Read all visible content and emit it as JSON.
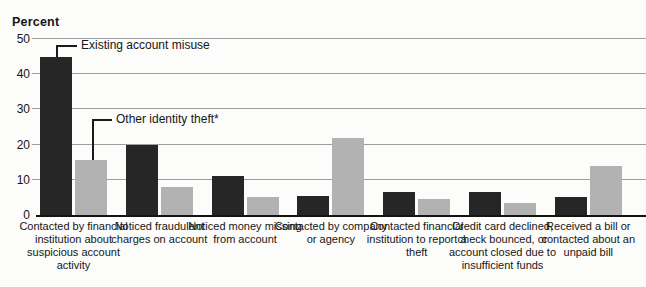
{
  "chart_data": {
    "type": "bar",
    "title": "",
    "ylabel": "Percent",
    "xlabel": "",
    "ylim": [
      0,
      50
    ],
    "yticks": [
      0,
      10,
      20,
      30,
      40,
      50
    ],
    "grid": true,
    "legend_position": "inline annotations with elbow connector lines pointing to first bar group",
    "categories": [
      "Contacted by financial institution about suspicious account activity",
      "Noticed fraudulent charges on account",
      "Noticed money missing from account",
      "Contacted by company or agency",
      "Contacted financial institution to report a theft",
      "Credit card declined, check bounced, or account closed due to insufficient funds",
      "Received a bill or contacted about an unpaid bill"
    ],
    "series": [
      {
        "name": "Existing account misuse",
        "color": "#262626",
        "values": [
          45,
          20,
          11,
          5.5,
          6.5,
          6.5,
          5
        ]
      },
      {
        "name": "Other identity theft*",
        "color": "#b2b2b2",
        "values": [
          15.5,
          8,
          5,
          22,
          4.5,
          3.5,
          14
        ]
      }
    ]
  }
}
